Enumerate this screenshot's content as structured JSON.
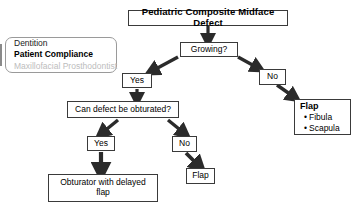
{
  "diagram": {
    "title": "Pediatric Composite Midface Defect",
    "type": "flowchart",
    "background_color": "#ffffff",
    "border_color": "#3a3a3a",
    "muted_text_color": "#bdbdbd"
  },
  "info_panel": {
    "name": "considerations-panel",
    "lines": [
      {
        "text": "Dentition",
        "style": "normal"
      },
      {
        "text": "Patient Compliance",
        "style": "bold"
      },
      {
        "text": "Maxillofacial Prosthodontist",
        "style": "muted"
      }
    ]
  },
  "nodes": {
    "root": {
      "label": "Pediatric Composite Midface Defect"
    },
    "growing": {
      "label": "Growing?"
    },
    "growing_yes": {
      "label": "Yes"
    },
    "growing_no": {
      "label": "No"
    },
    "obturate": {
      "label": "Can defect be obturated?"
    },
    "obturate_yes": {
      "label": "Yes"
    },
    "obturate_no": {
      "label": "No"
    },
    "obturator_result": {
      "label": "Obturator with delayed flap"
    },
    "flap_result": {
      "label": "Flap"
    },
    "flap_options": {
      "heading": "Flap",
      "bullet": "•",
      "items": [
        "Fibula",
        "Scapula"
      ]
    }
  },
  "edges": [
    {
      "from": "root",
      "to": "growing",
      "direction": "down"
    },
    {
      "from": "growing",
      "to": "growing_yes",
      "direction": "down-left"
    },
    {
      "from": "growing",
      "to": "growing_no",
      "direction": "down-right"
    },
    {
      "from": "growing_yes",
      "to": "obturate",
      "direction": "down"
    },
    {
      "from": "growing_no",
      "to": "flap_options",
      "direction": "down-right"
    },
    {
      "from": "obturate",
      "to": "obturate_yes",
      "direction": "down-left"
    },
    {
      "from": "obturate",
      "to": "obturate_no",
      "direction": "down-right"
    },
    {
      "from": "obturate_yes",
      "to": "obturator_result",
      "direction": "down"
    },
    {
      "from": "obturate_no",
      "to": "flap_result",
      "direction": "down-right"
    }
  ]
}
